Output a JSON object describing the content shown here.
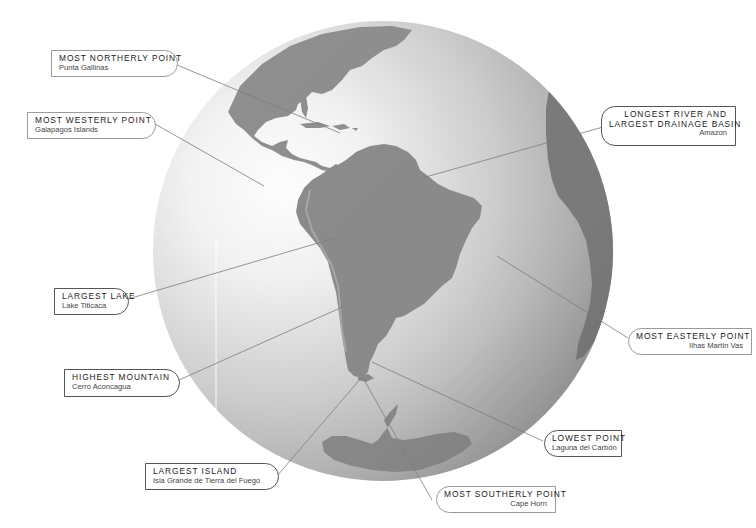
{
  "figure": {
    "colors": {
      "background": "#ffffff",
      "ocean_highlight": "#ffffff",
      "ocean_edge": "#9c9c9c",
      "land": "#8e8e8e",
      "land_dark": "#7a7a7a",
      "leader_line": "#7c7c7c",
      "label_border": "#9a9a9a"
    }
  },
  "labels": [
    {
      "id": "most-northerly",
      "title": "MOST NORTHERLY POINT",
      "subtitle": "Punta Gallinas"
    },
    {
      "id": "most-westerly",
      "title": "MOST WESTERLY POINT",
      "subtitle": "Galapagos Islands"
    },
    {
      "id": "longest-river",
      "title_line1": "LONGEST RIVER AND",
      "title_line2": "LARGEST DRAINAGE BASIN",
      "subtitle": "Amazon"
    },
    {
      "id": "largest-lake",
      "title": "LARGEST LAKE",
      "subtitle": "Lake Titicaca"
    },
    {
      "id": "most-easterly",
      "title": "MOST EASTERLY POINT",
      "subtitle": "Ilhas Martin Vas"
    },
    {
      "id": "highest-mountain",
      "title": "HIGHEST MOUNTAIN",
      "subtitle": "Cerro Aconcagua"
    },
    {
      "id": "lowest-point",
      "title": "LOWEST POINT",
      "subtitle": "Laguna del Carbón"
    },
    {
      "id": "largest-island",
      "title": "LARGEST ISLAND",
      "subtitle": "Isla Grande de Tierra del Fuego"
    },
    {
      "id": "most-southerly",
      "title": "MOST SOUTHERLY POINT",
      "subtitle": "Cape Horn"
    }
  ]
}
